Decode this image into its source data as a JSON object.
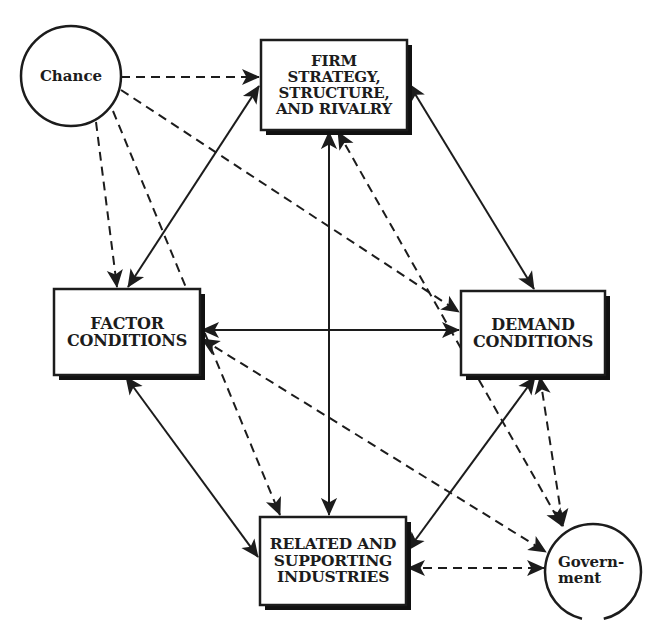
{
  "diagram": {
    "colors": {
      "stroke": "#1c1c1c",
      "background": "#ffffff",
      "shadow": "#111111"
    },
    "nodes": {
      "chance": {
        "label": "Chance",
        "shape": "circle",
        "cx": 71,
        "cy": 76,
        "r": 50
      },
      "firm": {
        "label": "FIRM\nSTRATEGY,\nSTRUCTURE,\nAND RIVALRY",
        "shape": "box",
        "x": 261,
        "y": 40,
        "w": 146,
        "h": 90
      },
      "factor": {
        "label": "FACTOR\nCONDITIONS",
        "shape": "box",
        "x": 54,
        "y": 289,
        "w": 146,
        "h": 86
      },
      "demand": {
        "label": "DEMAND\nCONDITIONS",
        "shape": "box",
        "x": 461,
        "y": 291,
        "w": 144,
        "h": 84
      },
      "related": {
        "label": "RELATED AND\nSUPPORTING\nINDUSTRIES",
        "shape": "box",
        "x": 260,
        "y": 517,
        "w": 146,
        "h": 88
      },
      "government": {
        "label": "Govern-\nment",
        "shape": "circle",
        "cx": 593,
        "cy": 572,
        "r": 48
      }
    },
    "edges": [
      {
        "from": "chance",
        "to": "firm",
        "style": "dashed",
        "direction": "forward",
        "x1": 121,
        "y1": 77,
        "x2": 259,
        "y2": 77
      },
      {
        "from": "chance",
        "to": "factor",
        "style": "dashed",
        "direction": "forward",
        "x1": 96,
        "y1": 122,
        "x2": 117,
        "y2": 287
      },
      {
        "from": "chance",
        "to": "related",
        "style": "dashed",
        "direction": "forward",
        "x1": 113,
        "y1": 111,
        "x2": 280,
        "y2": 515
      },
      {
        "from": "chance",
        "to": "demand",
        "style": "dashed",
        "direction": "forward",
        "x1": 121,
        "y1": 90,
        "x2": 459,
        "y2": 312
      },
      {
        "from": "firm",
        "to": "factor",
        "style": "solid",
        "direction": "both",
        "x1": 259,
        "y1": 86,
        "x2": 128,
        "y2": 287
      },
      {
        "from": "firm",
        "to": "demand",
        "style": "solid",
        "direction": "both",
        "x1": 409,
        "y1": 84,
        "x2": 534,
        "y2": 289
      },
      {
        "from": "firm",
        "to": "related",
        "style": "solid",
        "direction": "both",
        "x1": 329,
        "y1": 132,
        "x2": 329,
        "y2": 515
      },
      {
        "from": "firm",
        "to": "government",
        "style": "dashed",
        "direction": "both",
        "x1": 338,
        "y1": 132,
        "x2": 562,
        "y2": 526
      },
      {
        "from": "factor",
        "to": "demand",
        "style": "solid",
        "direction": "both",
        "x1": 202,
        "y1": 330,
        "x2": 459,
        "y2": 330
      },
      {
        "from": "factor",
        "to": "government",
        "style": "dashed",
        "direction": "both",
        "x1": 202,
        "y1": 339,
        "x2": 546,
        "y2": 552
      },
      {
        "from": "factor",
        "to": "related",
        "style": "solid",
        "direction": "both",
        "x1": 126,
        "y1": 377,
        "x2": 258,
        "y2": 557
      },
      {
        "from": "demand",
        "to": "related",
        "style": "solid",
        "direction": "both",
        "x1": 535,
        "y1": 377,
        "x2": 408,
        "y2": 550
      },
      {
        "from": "demand",
        "to": "government",
        "style": "dashed",
        "direction": "both",
        "x1": 540,
        "y1": 377,
        "x2": 563,
        "y2": 526
      },
      {
        "from": "related",
        "to": "government",
        "style": "dashed",
        "direction": "both",
        "x1": 408,
        "y1": 568,
        "x2": 544,
        "y2": 568
      }
    ]
  },
  "caption": {
    "text": "",
    "visible_fragment": "partially cut off at bottom edge"
  }
}
